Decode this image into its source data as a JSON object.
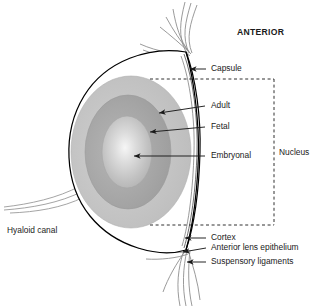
{
  "figure": {
    "title_label": "ANTERIOR"
  },
  "labels": {
    "anterior": "ANTERIOR",
    "capsule": "Capsule",
    "adult": "Adult",
    "fetal": "Fetal",
    "embryonal": "Embryonal",
    "nucleus": "Nucleus",
    "cortex": "Cortex",
    "anterior_lens_epithelium": "Anterior lens epithelium",
    "suspensory_ligaments": "Suspensory ligaments",
    "hyaloid_canal": "Hyaloid canal"
  },
  "colors": {
    "outline": "#000000",
    "text": "#1a1a1a",
    "leader": "#1a1a1a",
    "bracket": "#1a1a1a",
    "zonule": "#8c8c8c",
    "adult_ring": "#c3c3c3",
    "fetal_ring": "#a9a9a9",
    "embryonal_core": "#c9c9c9",
    "embryonal_center": "#f4f4f4",
    "background": "#ffffff"
  }
}
